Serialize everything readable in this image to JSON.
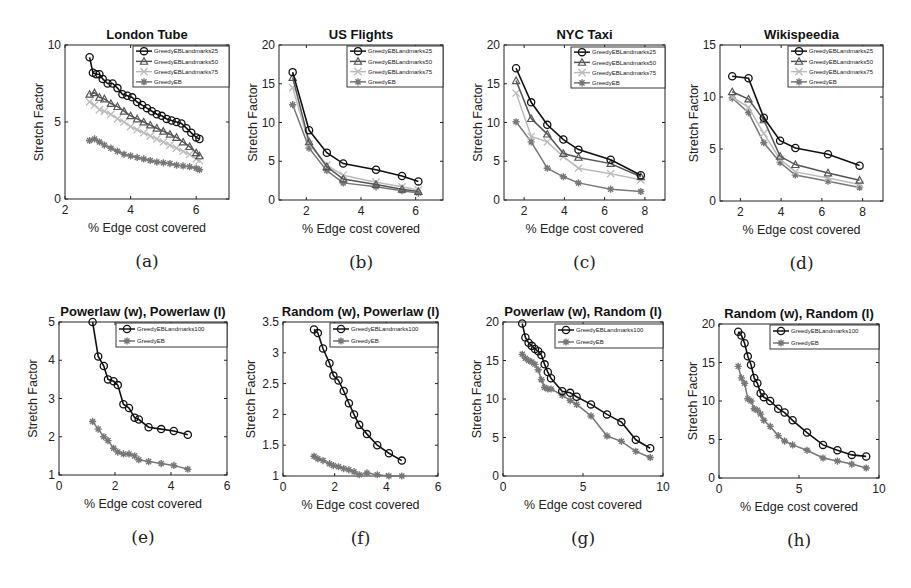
{
  "figure": {
    "panels": [
      {
        "id": "a",
        "caption": "(a)",
        "title": "London Tube"
      },
      {
        "id": "b",
        "caption": "(b)",
        "title": "US Flights"
      },
      {
        "id": "c",
        "caption": "(c)",
        "title": "NYC Taxi"
      },
      {
        "id": "d",
        "caption": "(d)",
        "title": "Wikispeedia"
      },
      {
        "id": "e",
        "caption": "(e)",
        "title": "Powerlaw (w), Powerlaw (l)"
      },
      {
        "id": "f",
        "caption": "(f)",
        "title": "Random (w), Powerlaw (l)"
      },
      {
        "id": "g",
        "caption": "(g)",
        "title": "Powerlaw (w), Random (l)"
      },
      {
        "id": "h",
        "caption": "(h)",
        "title": "Random (w), Random (l)"
      }
    ],
    "colors": {
      "s25": "#111111",
      "s50": "#555555",
      "s75": "#bbbbbb",
      "eb": "#777777",
      "l100": "#111111"
    }
  },
  "chart_data": [
    {
      "id": "a",
      "type": "line",
      "title": "London Tube",
      "xlabel": "% Edge cost covered",
      "ylabel": "Stretch Factor",
      "xlim": [
        2,
        7
      ],
      "ylim": [
        0,
        10
      ],
      "xticks": [
        2,
        4,
        6
      ],
      "yticks": [
        0,
        5,
        10
      ],
      "legend_position": "upper right",
      "series": [
        {
          "name": "GreedyEBLandmarks25",
          "marker": "o",
          "x": [
            2.75,
            2.85,
            2.95,
            3.05,
            3.15,
            3.3,
            3.45,
            3.6,
            3.75,
            3.9,
            4.05,
            4.2,
            4.35,
            4.5,
            4.65,
            4.8,
            4.95,
            5.1,
            5.25,
            5.4,
            5.55,
            5.7,
            5.85,
            6.0,
            6.1
          ],
          "y": [
            9.2,
            8.2,
            8.1,
            8.1,
            7.8,
            7.5,
            7.5,
            7.2,
            6.8,
            6.7,
            6.6,
            6.3,
            6.1,
            5.9,
            5.7,
            5.5,
            5.4,
            5.2,
            5.1,
            5.0,
            4.9,
            4.6,
            4.3,
            4.0,
            3.9
          ]
        },
        {
          "name": "GreedyEBLandmarks50",
          "marker": "^",
          "x": [
            2.75,
            2.9,
            3.05,
            3.2,
            3.4,
            3.6,
            3.8,
            4.0,
            4.2,
            4.4,
            4.6,
            4.8,
            5.0,
            5.2,
            5.4,
            5.6,
            5.8,
            6.0,
            6.1
          ],
          "y": [
            6.8,
            6.9,
            6.6,
            6.5,
            6.2,
            6.0,
            5.7,
            5.4,
            5.2,
            5.0,
            4.8,
            4.6,
            4.4,
            4.2,
            4.0,
            3.7,
            3.4,
            3.0,
            2.8
          ]
        },
        {
          "name": "GreedyEBLandmarks75",
          "marker": "x",
          "x": [
            2.75,
            2.9,
            3.05,
            3.2,
            3.4,
            3.6,
            3.8,
            4.0,
            4.2,
            4.4,
            4.6,
            4.8,
            5.0,
            5.2,
            5.4,
            5.6,
            5.8,
            6.0,
            6.1
          ],
          "y": [
            6.3,
            6.1,
            5.8,
            5.7,
            5.5,
            5.2,
            5.0,
            4.7,
            4.5,
            4.3,
            4.1,
            3.9,
            3.7,
            3.5,
            3.3,
            3.1,
            2.9,
            2.6,
            2.5
          ]
        },
        {
          "name": "GreedyEB",
          "marker": "*",
          "x": [
            2.75,
            2.9,
            3.05,
            3.2,
            3.4,
            3.6,
            3.8,
            4.0,
            4.2,
            4.4,
            4.6,
            4.8,
            5.0,
            5.2,
            5.4,
            5.6,
            5.8,
            6.0,
            6.1
          ],
          "y": [
            3.8,
            3.9,
            3.7,
            3.5,
            3.3,
            3.1,
            2.9,
            2.8,
            2.7,
            2.6,
            2.5,
            2.4,
            2.35,
            2.3,
            2.2,
            2.15,
            2.1,
            2.0,
            1.9
          ]
        }
      ]
    },
    {
      "id": "b",
      "type": "line",
      "title": "US Flights",
      "xlabel": "% Edge cost covered",
      "ylabel": "Stretch Factor",
      "xlim": [
        1,
        7
      ],
      "ylim": [
        0,
        20
      ],
      "xticks": [
        2,
        4,
        6
      ],
      "yticks": [
        0,
        5,
        10,
        15,
        20
      ],
      "legend_position": "upper right",
      "series": [
        {
          "name": "GreedyEBLandmarks25",
          "marker": "o",
          "x": [
            1.5,
            2.1,
            2.75,
            3.35,
            4.55,
            5.5,
            6.1
          ],
          "y": [
            16.5,
            9.0,
            6.1,
            4.7,
            3.9,
            3.1,
            2.4
          ]
        },
        {
          "name": "GreedyEBLandmarks50",
          "marker": "^",
          "x": [
            1.5,
            2.1,
            2.75,
            3.35,
            4.55,
            5.5,
            6.1
          ],
          "y": [
            15.8,
            7.5,
            4.3,
            2.7,
            2.0,
            1.4,
            1.1
          ]
        },
        {
          "name": "GreedyEBLandmarks75",
          "marker": "x",
          "x": [
            1.5,
            2.1,
            2.75,
            3.35,
            4.55,
            5.5,
            6.1
          ],
          "y": [
            14.5,
            7.2,
            4.5,
            3.2,
            2.3,
            1.7,
            1.3
          ]
        },
        {
          "name": "GreedyEB",
          "marker": "*",
          "x": [
            1.5,
            2.1,
            2.75,
            3.35,
            4.55,
            5.5,
            6.1
          ],
          "y": [
            12.3,
            6.7,
            3.8,
            2.2,
            1.7,
            1.2,
            0.9
          ]
        }
      ]
    },
    {
      "id": "c",
      "type": "line",
      "title": "NYC Taxi",
      "xlabel": "% Edge cost covered",
      "ylabel": "Stretch Factor",
      "xlim": [
        1,
        9
      ],
      "ylim": [
        0,
        20
      ],
      "xticks": [
        2,
        4,
        6,
        8
      ],
      "yticks": [
        0,
        5,
        10,
        15,
        20
      ],
      "legend_position": "upper right",
      "series": [
        {
          "name": "GreedyEBLandmarks25",
          "marker": "o",
          "x": [
            1.6,
            2.35,
            3.15,
            3.95,
            4.7,
            6.3,
            7.8
          ],
          "y": [
            17.0,
            12.6,
            9.7,
            7.8,
            6.5,
            5.2,
            3.2
          ]
        },
        {
          "name": "GreedyEBLandmarks50",
          "marker": "^",
          "x": [
            1.6,
            2.35,
            3.15,
            3.95,
            4.7,
            6.3,
            7.8
          ],
          "y": [
            15.4,
            10.5,
            8.5,
            6.0,
            5.5,
            4.7,
            3.0
          ]
        },
        {
          "name": "GreedyEBLandmarks75",
          "marker": "x",
          "x": [
            1.6,
            2.35,
            3.15,
            3.95,
            4.7,
            6.3,
            7.8
          ],
          "y": [
            13.8,
            8.2,
            7.5,
            5.6,
            4.1,
            3.4,
            2.6
          ]
        },
        {
          "name": "GreedyEB",
          "marker": "*",
          "x": [
            1.6,
            2.35,
            3.15,
            3.95,
            4.7,
            6.3,
            7.8
          ],
          "y": [
            10.1,
            7.5,
            4.1,
            3.0,
            2.2,
            1.4,
            1.1
          ]
        }
      ]
    },
    {
      "id": "d",
      "type": "line",
      "title": "Wikispeedia",
      "xlabel": "% Edge cost covered",
      "ylabel": "Stretch Factor",
      "xlim": [
        1,
        9
      ],
      "ylim": [
        0,
        15
      ],
      "xticks": [
        2,
        4,
        6,
        8
      ],
      "yticks": [
        0,
        5,
        10,
        15
      ],
      "legend_position": "upper right",
      "series": [
        {
          "name": "GreedyEBLandmarks25",
          "marker": "o",
          "x": [
            1.6,
            2.4,
            3.15,
            3.95,
            4.7,
            6.3,
            7.85
          ],
          "y": [
            12.0,
            11.8,
            8.0,
            5.8,
            5.1,
            4.5,
            3.4
          ]
        },
        {
          "name": "GreedyEBLandmarks50",
          "marker": "^",
          "x": [
            1.6,
            2.4,
            3.15,
            3.95,
            4.7,
            6.3,
            7.85
          ],
          "y": [
            10.5,
            9.8,
            7.8,
            4.3,
            3.5,
            2.7,
            2.0
          ]
        },
        {
          "name": "GreedyEBLandmarks75",
          "marker": "x",
          "x": [
            1.6,
            2.4,
            3.15,
            3.95,
            4.7,
            6.3,
            7.85
          ],
          "y": [
            10.0,
            9.0,
            6.5,
            4.0,
            2.8,
            2.2,
            1.6
          ]
        },
        {
          "name": "GreedyEB",
          "marker": "*",
          "x": [
            1.6,
            2.4,
            3.15,
            3.95,
            4.7,
            6.3,
            7.85
          ],
          "y": [
            9.9,
            8.5,
            5.6,
            3.7,
            2.5,
            1.9,
            1.3
          ]
        }
      ]
    },
    {
      "id": "e",
      "type": "line",
      "title": "Powerlaw (w), Powerlaw (l)",
      "xlabel": "% Edge cost covered",
      "ylabel": "Stretch Factor",
      "xlim": [
        0,
        6
      ],
      "ylim": [
        1,
        5
      ],
      "xticks": [
        0,
        2,
        4,
        6
      ],
      "yticks": [
        1,
        2,
        3,
        4,
        5
      ],
      "legend_position": "upper right",
      "series": [
        {
          "name": "GreedyEBLandmarks100",
          "marker": "o",
          "x": [
            1.2,
            1.4,
            1.6,
            1.75,
            1.95,
            2.1,
            2.3,
            2.5,
            2.7,
            2.85,
            3.2,
            3.65,
            4.1,
            4.6
          ],
          "y": [
            5.0,
            4.1,
            3.85,
            3.5,
            3.45,
            3.35,
            2.85,
            2.75,
            2.5,
            2.45,
            2.25,
            2.2,
            2.15,
            2.05
          ]
        },
        {
          "name": "GreedyEB",
          "marker": "*",
          "x": [
            1.2,
            1.4,
            1.6,
            1.75,
            1.95,
            2.1,
            2.3,
            2.5,
            2.7,
            2.85,
            3.2,
            3.65,
            4.1,
            4.6
          ],
          "y": [
            2.4,
            2.2,
            2.0,
            1.9,
            1.7,
            1.6,
            1.55,
            1.55,
            1.5,
            1.4,
            1.35,
            1.3,
            1.25,
            1.15
          ]
        }
      ]
    },
    {
      "id": "f",
      "type": "line",
      "title": "Random (w), Powerlaw (l)",
      "xlabel": "% Edge cost covered",
      "ylabel": "Stretch Factor",
      "xlim": [
        0,
        6
      ],
      "ylim": [
        1,
        3.5
      ],
      "xticks": [
        0,
        2,
        4,
        6
      ],
      "yticks": [
        1,
        1.5,
        2,
        2.5,
        3,
        3.5
      ],
      "legend_position": "upper right",
      "series": [
        {
          "name": "GreedyEBLandmarks100",
          "marker": "o",
          "x": [
            1.2,
            1.35,
            1.55,
            1.8,
            1.95,
            2.15,
            2.35,
            2.55,
            2.75,
            2.95,
            3.25,
            3.65,
            4.1,
            4.6
          ],
          "y": [
            3.38,
            3.32,
            3.07,
            2.83,
            2.63,
            2.55,
            2.38,
            2.18,
            2.0,
            1.83,
            1.68,
            1.5,
            1.37,
            1.25
          ]
        },
        {
          "name": "GreedyEB",
          "marker": "*",
          "x": [
            1.2,
            1.35,
            1.55,
            1.8,
            1.95,
            2.15,
            2.35,
            2.55,
            2.75,
            2.95,
            3.25,
            3.65,
            4.1,
            4.6
          ],
          "y": [
            1.32,
            1.28,
            1.25,
            1.2,
            1.17,
            1.15,
            1.12,
            1.1,
            1.07,
            1.02,
            1.05,
            1.02,
            1.0,
            1.0
          ]
        }
      ]
    },
    {
      "id": "g",
      "type": "line",
      "title": "Powerlaw (w), Random (l)",
      "xlabel": "% Edge cost covered",
      "ylabel": "Stretch Factor",
      "xlim": [
        0,
        10
      ],
      "ylim": [
        0,
        20
      ],
      "xticks": [
        0,
        5,
        10
      ],
      "yticks": [
        0,
        5,
        10,
        15,
        20
      ],
      "legend_position": "upper right",
      "series": [
        {
          "name": "GreedyEBLandmarks100",
          "marker": "o",
          "x": [
            1.2,
            1.4,
            1.6,
            1.8,
            2.0,
            2.2,
            2.4,
            2.6,
            2.8,
            3.0,
            3.7,
            4.2,
            4.6,
            5.5,
            6.5,
            7.4,
            8.3,
            9.2
          ],
          "y": [
            19.8,
            18.0,
            17.3,
            16.9,
            16.5,
            16.2,
            15.7,
            14.5,
            13.5,
            12.7,
            11.0,
            10.8,
            10.3,
            9.3,
            8.0,
            7.0,
            4.7,
            3.6
          ]
        },
        {
          "name": "GreedyEB",
          "marker": "*",
          "x": [
            1.2,
            1.4,
            1.6,
            1.8,
            2.0,
            2.2,
            2.4,
            2.6,
            2.8,
            3.0,
            3.7,
            4.2,
            4.6,
            5.5,
            6.5,
            7.4,
            8.3,
            9.2
          ],
          "y": [
            15.8,
            15.3,
            15.0,
            14.8,
            14.5,
            13.8,
            12.5,
            11.5,
            11.3,
            11.3,
            10.5,
            9.8,
            9.3,
            7.8,
            5.2,
            4.5,
            3.2,
            2.4
          ]
        }
      ]
    },
    {
      "id": "h",
      "type": "line",
      "title": "Random (w), Random (l)",
      "xlabel": "% Edge cost covered",
      "ylabel": "Stretch Factor",
      "xlim": [
        0,
        10
      ],
      "ylim": [
        0,
        20
      ],
      "xticks": [
        0,
        5,
        10
      ],
      "yticks": [
        0,
        5,
        10,
        15,
        20
      ],
      "legend_position": "upper right",
      "series": [
        {
          "name": "GreedyEBLandmarks100",
          "marker": "o",
          "x": [
            1.2,
            1.4,
            1.6,
            1.8,
            2.0,
            2.2,
            2.4,
            2.6,
            2.8,
            3.2,
            3.7,
            4.1,
            4.6,
            5.5,
            6.5,
            7.4,
            8.3,
            9.2
          ],
          "y": [
            19.0,
            18.5,
            17.5,
            15.8,
            14.7,
            13.0,
            12.3,
            11.0,
            10.5,
            10.0,
            9.0,
            8.5,
            7.5,
            5.9,
            4.3,
            3.6,
            3.0,
            2.8
          ]
        },
        {
          "name": "GreedyEB",
          "marker": "*",
          "x": [
            1.2,
            1.4,
            1.6,
            1.8,
            2.0,
            2.2,
            2.4,
            2.6,
            2.8,
            3.2,
            3.7,
            4.1,
            4.6,
            5.5,
            6.5,
            7.4,
            8.3,
            9.2
          ],
          "y": [
            14.5,
            13.0,
            12.3,
            10.3,
            10.0,
            9.0,
            8.8,
            8.3,
            7.5,
            6.7,
            5.5,
            4.8,
            4.3,
            3.6,
            2.6,
            2.2,
            1.8,
            1.3
          ]
        }
      ]
    }
  ]
}
